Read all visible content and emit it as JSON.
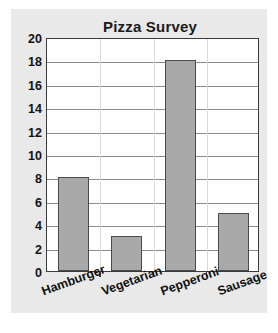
{
  "chart_data": {
    "type": "bar",
    "title": "Pizza Survey",
    "xlabel": "",
    "ylabel": "",
    "categories": [
      "Hamburger",
      "Vegetarian",
      "Pepperoni",
      "Sausage"
    ],
    "values": [
      8,
      3,
      18,
      5
    ],
    "ylim": [
      0,
      20
    ],
    "yticks": [
      0,
      2,
      4,
      6,
      8,
      10,
      12,
      14,
      16,
      18,
      20
    ],
    "ytick_labels": [
      "0",
      "2",
      "4",
      "6",
      "8",
      "10",
      "12",
      "14",
      "16",
      "18",
      "20"
    ],
    "grid": true,
    "legend": false,
    "legend_position": "none",
    "bar_color": "#a9a9a9",
    "bar_border_color": "#4a4a4a",
    "plot_background": "#ffffff",
    "panel_background": "#e9e9e9",
    "gridline_color": "#8c8c8c",
    "axis_color": "#3a3a3a",
    "text_color": "#111111"
  }
}
